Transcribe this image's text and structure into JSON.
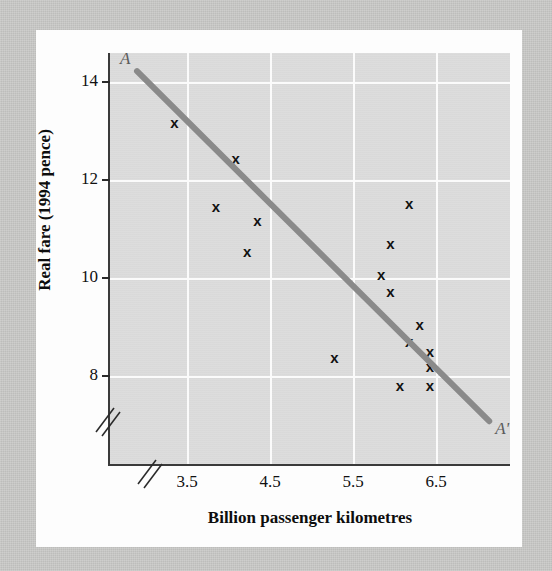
{
  "chart_data": {
    "type": "scatter",
    "title": "",
    "xlabel": "Billion passenger kilometres",
    "ylabel": "Real fare (1994 pence)",
    "xlim": [
      3.1,
      6.95
    ],
    "ylim": [
      7.3,
      14.55
    ],
    "xticks": [
      "3.5",
      "4.5",
      "5.5",
      "6.5"
    ],
    "xtick_values": [
      3.5,
      4.5,
      5.5,
      6.5
    ],
    "yticks": [
      "8",
      "10",
      "12",
      "14"
    ],
    "ytick_values": [
      8,
      10,
      12,
      14
    ],
    "grid": true,
    "axis_break_x": true,
    "axis_break_y": true,
    "marker_symbol": "x",
    "marker_color": "#111111",
    "plot_background": "#dcdcdc",
    "gridline_color": "#fbfbfb",
    "legend": "none",
    "points": [
      {
        "x": 3.72,
        "y": 13.32
      },
      {
        "x": 4.31,
        "y": 12.7
      },
      {
        "x": 4.12,
        "y": 11.85
      },
      {
        "x": 4.52,
        "y": 11.6
      },
      {
        "x": 4.42,
        "y": 11.05
      },
      {
        "x": 5.98,
        "y": 11.9
      },
      {
        "x": 5.8,
        "y": 11.2
      },
      {
        "x": 5.71,
        "y": 10.66
      },
      {
        "x": 5.8,
        "y": 10.36
      },
      {
        "x": 6.08,
        "y": 9.78
      },
      {
        "x": 5.98,
        "y": 9.48
      },
      {
        "x": 6.18,
        "y": 9.3
      },
      {
        "x": 6.18,
        "y": 9.03
      },
      {
        "x": 5.89,
        "y": 8.7
      },
      {
        "x": 6.18,
        "y": 8.7
      },
      {
        "x": 5.26,
        "y": 9.2
      }
    ],
    "trendline": {
      "name": "AA'",
      "color": "#8a8a8a",
      "width": 6,
      "start": {
        "x": 3.36,
        "y": 14.23,
        "label": "A"
      },
      "end": {
        "x": 6.75,
        "y": 8.07,
        "label": "A'"
      }
    }
  },
  "labels": {
    "y_title": "Real fare (1994 pence)",
    "x_title": "Billion passenger kilometres",
    "endpoint_start": "A",
    "endpoint_end": "A'"
  }
}
